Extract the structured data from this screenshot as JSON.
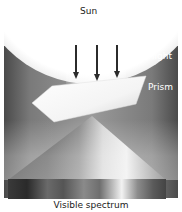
{
  "diagram": {
    "labels": {
      "sun": "Sun",
      "white_light": "White light",
      "prism": "Prism",
      "spectrum": "Visible spectrum"
    },
    "arrows": [
      {
        "x": 75,
        "y1": 45,
        "y2": 80
      },
      {
        "x": 96,
        "y1": 45,
        "y2": 80
      },
      {
        "x": 116,
        "y1": 45,
        "y2": 78
      }
    ],
    "colors": {
      "arrow": "#2b2b2b",
      "background_dark": "#4a4a4a",
      "sun": "#ffffff"
    }
  }
}
